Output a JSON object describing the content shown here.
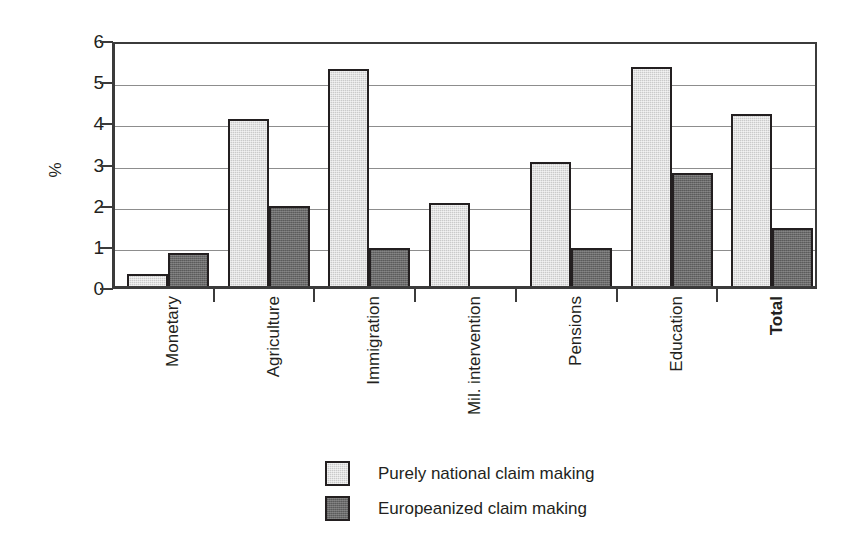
{
  "chart_data": {
    "type": "bar",
    "title": "",
    "subtitle": "",
    "xlabel": "",
    "ylabel": "%",
    "ylim": [
      0,
      6
    ],
    "yticks": [
      0,
      1,
      2,
      3,
      4,
      5,
      6
    ],
    "ytick_labels": [
      "0",
      "1",
      "2",
      "3",
      "4",
      "5",
      "6"
    ],
    "grid": true,
    "grid_axis": "y",
    "legend_position": "bottom-center",
    "categories": [
      "Monetary",
      "Agriculture",
      "Immigration",
      "Mil. intervention",
      "Pensions",
      "Education",
      "Total"
    ],
    "category_styles": [
      "normal",
      "normal",
      "normal",
      "normal",
      "normal",
      "normal",
      "bold"
    ],
    "series": [
      {
        "name": "Purely national claim making",
        "color": "#cacaca",
        "values": [
          0.3,
          4.05,
          5.28,
          2.02,
          3.02,
          5.32,
          4.18
        ]
      },
      {
        "name": "Europeanized claim making",
        "color": "#6a6a6a",
        "values": [
          0.8,
          1.95,
          0.93,
          0.0,
          0.93,
          2.75,
          1.42
        ]
      }
    ]
  },
  "legend": {
    "entries": [
      {
        "label": "Purely national claim making",
        "color": "#cacaca"
      },
      {
        "label": "Europeanized claim making",
        "color": "#6a6a6a"
      }
    ]
  },
  "axes": {
    "y_title": "%",
    "axis_color": "#3b3b3b",
    "gridline_color": "#8d8d8d"
  }
}
